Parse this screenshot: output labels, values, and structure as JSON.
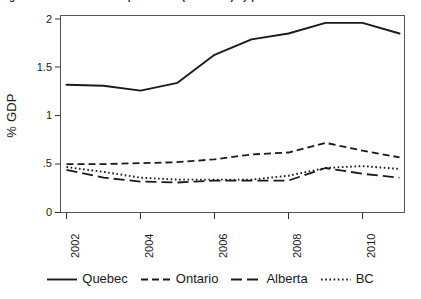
{
  "figure": {
    "title_clipped": "Figure 1: Business R&D expenditures (% of GDP) by province",
    "ylabel": "% GDP",
    "xlabel": ""
  },
  "legend": {
    "position": "bottom",
    "entries": [
      {
        "label": "Quebec",
        "style": "solid",
        "swatch": "legend-swatch-quebec"
      },
      {
        "label": "Ontario",
        "style": "dashed",
        "swatch": "legend-swatch-ontario"
      },
      {
        "label": "Alberta",
        "style": "long-dash",
        "swatch": "legend-swatch-alberta"
      },
      {
        "label": "BC",
        "style": "dotted",
        "swatch": "legend-swatch-bc"
      }
    ]
  },
  "axes": {
    "y_ticks": [
      "0",
      ".5",
      "1",
      "1.5",
      "2"
    ],
    "y_tick_values": [
      0,
      0.5,
      1,
      1.5,
      2
    ],
    "x_ticks": [
      "2002",
      "2004",
      "2006",
      "2008",
      "2010"
    ],
    "x_tick_values": [
      2002,
      2004,
      2006,
      2008,
      2010
    ]
  },
  "colors": {
    "line": "#1a1a1a",
    "frame": "#555555",
    "background": "#ffffff"
  },
  "chart_data": {
    "type": "line",
    "title": "Business R&D expenditures (% of GDP) by province",
    "xlabel": "",
    "ylabel": "% GDP",
    "x": [
      2002,
      2003,
      2004,
      2005,
      2006,
      2007,
      2008,
      2009,
      2010,
      2011
    ],
    "xlim": [
      2002,
      2011
    ],
    "ylim": [
      0,
      2
    ],
    "grid": false,
    "legend_position": "bottom",
    "series": [
      {
        "name": "Quebec",
        "dash": "solid",
        "values": [
          1.32,
          1.31,
          1.26,
          1.34,
          1.63,
          1.79,
          1.85,
          1.96,
          1.96,
          1.85
        ]
      },
      {
        "name": "Ontario",
        "dash": "dashed",
        "values": [
          0.5,
          0.5,
          0.51,
          0.52,
          0.55,
          0.6,
          0.62,
          0.72,
          0.64,
          0.57
        ]
      },
      {
        "name": "Alberta",
        "dash": "long-dash",
        "values": [
          0.44,
          0.36,
          0.32,
          0.31,
          0.33,
          0.33,
          0.33,
          0.46,
          0.4,
          0.36
        ]
      },
      {
        "name": "BC",
        "dash": "dotted",
        "values": [
          0.47,
          0.42,
          0.36,
          0.34,
          0.34,
          0.34,
          0.38,
          0.46,
          0.48,
          0.45
        ]
      }
    ]
  }
}
